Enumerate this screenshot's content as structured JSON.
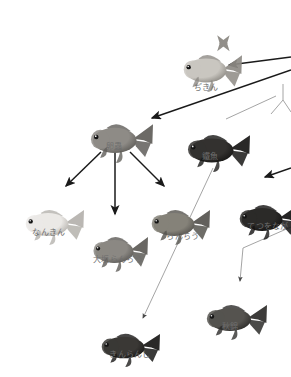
{
  "diagram": {
    "background_color": "#ffffff",
    "label_color": "#6d6d6d",
    "arrow_color": "#1a1a1a",
    "thin_line_color": "#9a9a9a"
  },
  "nodes": [
    {
      "id": "jikin",
      "label": "ぢきん",
      "x": 180,
      "y": 32,
      "w": 62,
      "h": 40,
      "label_x": 178,
      "label_y": 83,
      "label_w": 56,
      "body_color": "#c9c6c0",
      "body_dark": "#8d8a84",
      "tone": "pale",
      "has_x_tail": true
    },
    {
      "id": "ranchu-egg",
      "label": "卵蟲",
      "x": 87,
      "y": 100,
      "w": 66,
      "h": 42,
      "label_x": 94,
      "label_y": 142,
      "label_w": 40,
      "body_color": "#8e8b86",
      "body_dark": "#5f5d59",
      "tone": "mid",
      "has_x_tail": false
    },
    {
      "id": "tetsugyo",
      "label": "鐵魚",
      "x": 184,
      "y": 112,
      "w": 66,
      "h": 40,
      "label_x": 192,
      "label_y": 152,
      "label_w": 36,
      "body_color": "#33312f",
      "body_dark": "#171615",
      "tone": "dark",
      "has_x_tail": false
    },
    {
      "id": "nankin",
      "label": "なんきん",
      "x": 22,
      "y": 188,
      "w": 62,
      "h": 38,
      "label_x": 18,
      "label_y": 228,
      "label_w": 62,
      "body_color": "#ebe9e6",
      "body_dark": "#b4b1ac",
      "tone": "white",
      "has_x_tail": false
    },
    {
      "id": "osaka-ranchu",
      "label": "大坂らんちう",
      "x": 90,
      "y": 215,
      "w": 58,
      "h": 38,
      "label_x": 78,
      "label_y": 255,
      "label_w": 80,
      "body_color": "#8b8883",
      "body_dark": "#5c5a56",
      "tone": "mid",
      "has_x_tail": false
    },
    {
      "id": "ranchu",
      "label": "らんちう",
      "x": 148,
      "y": 188,
      "w": 62,
      "h": 38,
      "label_x": 156,
      "label_y": 232,
      "label_w": 54,
      "body_color": "#858279",
      "body_dark": "#55534e",
      "tone": "mid",
      "has_x_tail": false
    },
    {
      "id": "tetsuonaga",
      "label": "てつをなが",
      "x": 236,
      "y": 183,
      "w": 62,
      "h": 38,
      "label_x": 240,
      "label_y": 222,
      "label_w": 56,
      "body_color": "#2b2a28",
      "body_dark": "#131212",
      "tone": "dark",
      "has_x_tail": false
    },
    {
      "id": "akinishiki",
      "label": "秋錦",
      "x": 203,
      "y": 283,
      "w": 64,
      "h": 38,
      "label_x": 212,
      "label_y": 322,
      "label_w": 36,
      "body_color": "#55534f",
      "body_dark": "#2c2b29",
      "tone": "darkmid",
      "has_x_tail": false
    },
    {
      "id": "kinranshi",
      "label": "きんらんし",
      "x": 98,
      "y": 313,
      "w": 62,
      "h": 36,
      "label_x": 100,
      "label_y": 350,
      "label_w": 60,
      "body_color": "#3a3835",
      "body_dark": "#181716",
      "tone": "dark",
      "has_x_tail": false
    }
  ],
  "arrows": [
    {
      "id": "to-jikin-from-right",
      "x1": 291,
      "y1": 57,
      "x2": 229,
      "y2": 65,
      "style": "thick",
      "head": true
    },
    {
      "id": "to-egg-from-right",
      "x1": 291,
      "y1": 70,
      "x2": 152,
      "y2": 118,
      "style": "thick",
      "head": true
    },
    {
      "id": "egg-to-nankin",
      "x1": 101,
      "y1": 152,
      "x2": 66,
      "y2": 186,
      "style": "thick",
      "head": true
    },
    {
      "id": "egg-to-osaka",
      "x1": 115,
      "y1": 152,
      "x2": 115,
      "y2": 214,
      "style": "thick",
      "head": true
    },
    {
      "id": "egg-to-ranchu",
      "x1": 130,
      "y1": 152,
      "x2": 164,
      "y2": 186,
      "style": "thick",
      "head": true
    },
    {
      "id": "to-tetsuonaga",
      "x1": 291,
      "y1": 168,
      "x2": 265,
      "y2": 177,
      "style": "thick",
      "head": true
    },
    {
      "id": "tetsugyo-to-kinranshi",
      "x1": 213,
      "y1": 168,
      "x2": 143,
      "y2": 318,
      "style": "thin",
      "head": true
    },
    {
      "id": "branch-to-akinishiki",
      "x1": 291,
      "y1": 227,
      "x2": 243,
      "y2": 248,
      "style": "thin",
      "head": false
    },
    {
      "id": "branch-down-akinishiki",
      "x1": 243,
      "y1": 248,
      "x2": 240,
      "y2": 281,
      "style": "thin",
      "head": true
    },
    {
      "id": "jikin-to-tetsugyo-thin",
      "x1": 276,
      "y1": 96,
      "x2": 226,
      "y2": 119,
      "style": "thin",
      "head": false
    },
    {
      "id": "fork-top-stem",
      "x1": 283,
      "y1": 84,
      "x2": 283,
      "y2": 100,
      "style": "thin",
      "head": false
    },
    {
      "id": "fork-left-branch",
      "x1": 283,
      "y1": 100,
      "x2": 271,
      "y2": 114,
      "style": "thin",
      "head": false
    },
    {
      "id": "fork-right-branch",
      "x1": 283,
      "y1": 100,
      "x2": 291,
      "y2": 112,
      "style": "thin",
      "head": false
    }
  ]
}
